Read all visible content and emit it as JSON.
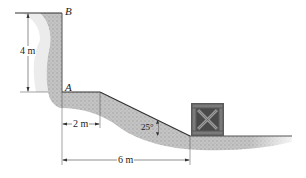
{
  "figure": {
    "type": "engineering-mechanics-diagram",
    "points": [
      {
        "id": "B",
        "label": "B"
      },
      {
        "id": "A",
        "label": "A"
      }
    ],
    "dimensions": [
      {
        "id": "height",
        "label": "4 m",
        "between": "A-B",
        "orientation": "vertical"
      },
      {
        "id": "ledge",
        "label": "2 m",
        "orientation": "horizontal"
      },
      {
        "id": "total",
        "label": "6 m",
        "orientation": "horizontal"
      }
    ],
    "angle": {
      "label": "25°",
      "value_deg": 25
    },
    "object": {
      "name": "crate"
    },
    "colors": {
      "line": "#333333",
      "soil": "#b8b8b8",
      "crate_frame": "#5a5a5a",
      "crate_fill": "#8a8a8a"
    }
  }
}
